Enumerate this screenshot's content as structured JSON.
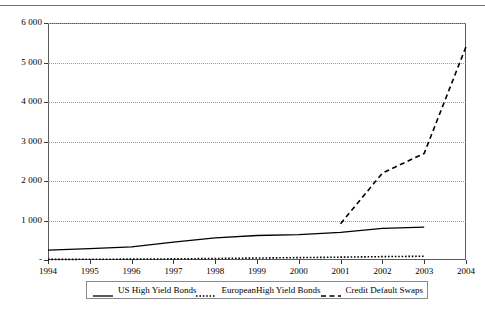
{
  "chart_data": {
    "type": "line",
    "title": "",
    "subtitle": "",
    "xlabel": "",
    "ylabel": "",
    "xlim": [
      1994,
      2004
    ],
    "ylim": [
      0,
      6000
    ],
    "grid": true,
    "legend_position": "bottom",
    "y_ticks": [
      "6 000",
      "5 000",
      "4 000",
      "3 000",
      "2 000",
      "1 000",
      "-"
    ],
    "y_tick_values": [
      6000,
      5000,
      4000,
      3000,
      2000,
      1000,
      0
    ],
    "x_ticks": [
      "1994",
      "1995",
      "1996",
      "1997",
      "1998",
      "1999",
      "2000",
      "2001",
      "2002",
      "2003",
      "2004"
    ],
    "x_tick_values": [
      1994,
      1995,
      1996,
      1997,
      1998,
      1999,
      2000,
      2001,
      2002,
      2003,
      2004
    ],
    "series": [
      {
        "name": "US High Yield Bonds",
        "style": "solid",
        "color": "#000000",
        "x": [
          1994,
          1995,
          1996,
          1997,
          1998,
          1999,
          2000,
          2001,
          2002,
          2003
        ],
        "values": [
          250,
          290,
          330,
          450,
          560,
          620,
          640,
          700,
          800,
          830
        ]
      },
      {
        "name": "EuropeanHigh Yield Bonds",
        "style": "dotted",
        "color": "#000000",
        "x": [
          1994,
          1995,
          1996,
          1997,
          1998,
          1999,
          2000,
          2001,
          2002,
          2003
        ],
        "values": [
          15,
          18,
          22,
          28,
          38,
          50,
          60,
          72,
          85,
          95
        ]
      },
      {
        "name": "Credit Default Swaps",
        "style": "dashed",
        "color": "#000000",
        "x": [
          2001,
          2002,
          2003,
          2004
        ],
        "values": [
          920,
          2200,
          2700,
          5400
        ]
      }
    ]
  },
  "legend": {
    "entries": [
      {
        "label": "US High Yield Bonds",
        "style": "solid"
      },
      {
        "label": "EuropeanHigh Yield Bonds",
        "style": "dotted"
      },
      {
        "label": "Credit Default Swaps",
        "style": "dashed"
      }
    ]
  }
}
